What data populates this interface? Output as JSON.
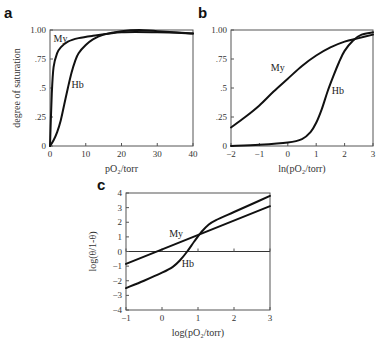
{
  "figure": {
    "panels": [
      "a",
      "b",
      "c"
    ]
  },
  "chart_data": [
    {
      "panel": "a",
      "type": "line",
      "title": "",
      "xlabel": "pO2/torr",
      "ylabel": "degree of saturation",
      "xlim": [
        0,
        40
      ],
      "ylim": [
        0,
        1
      ],
      "xticks": [
        0,
        10,
        20,
        30,
        40
      ],
      "xtick_labels": [
        "0",
        "10",
        "20",
        "30",
        "40"
      ],
      "yticks": [
        0,
        0.25,
        0.5,
        0.75,
        1.0
      ],
      "ytick_labels": [
        "0",
        ".25",
        ".5",
        ".75",
        "1.00"
      ],
      "grid": false,
      "series": [
        {
          "name": "My",
          "x": [
            0,
            0.5,
            1,
            2,
            3,
            5,
            8,
            12,
            20,
            30,
            40
          ],
          "y": [
            0,
            0.45,
            0.68,
            0.8,
            0.85,
            0.9,
            0.93,
            0.95,
            0.98,
            0.98,
            0.97
          ],
          "label_pos": [
            1,
            0.9
          ]
        },
        {
          "name": "Hb",
          "x": [
            0,
            1,
            2,
            3,
            4,
            5,
            6,
            7,
            8,
            10,
            12,
            15,
            20,
            25,
            30,
            40
          ],
          "y": [
            0,
            0.05,
            0.12,
            0.22,
            0.36,
            0.5,
            0.63,
            0.73,
            0.8,
            0.87,
            0.92,
            0.96,
            0.99,
            1.0,
            0.99,
            0.97
          ],
          "label_pos": [
            6,
            0.5
          ]
        }
      ]
    },
    {
      "panel": "b",
      "type": "line",
      "title": "",
      "xlabel": "ln(pO2/torr)",
      "ylabel": "",
      "xlim": [
        -2,
        3
      ],
      "ylim": [
        0,
        1
      ],
      "xticks": [
        -2,
        -1,
        0,
        1,
        2,
        3
      ],
      "xtick_labels": [
        "-2",
        "-1",
        "0",
        "1",
        "2",
        "3"
      ],
      "yticks": [
        0,
        0.25,
        0.5,
        0.75,
        1.0
      ],
      "ytick_labels": [
        "0",
        ".25",
        ".5",
        ".75",
        "1.00"
      ],
      "grid": false,
      "series": [
        {
          "name": "My",
          "x": [
            -2,
            -1.5,
            -1,
            -0.5,
            0,
            0.5,
            1,
            1.5,
            2,
            2.5,
            3
          ],
          "y": [
            0.16,
            0.25,
            0.35,
            0.47,
            0.58,
            0.69,
            0.78,
            0.85,
            0.9,
            0.93,
            0.96
          ],
          "label_pos": [
            -0.6,
            0.65
          ]
        },
        {
          "name": "Hb",
          "x": [
            -2,
            -1,
            0,
            0.5,
            0.8,
            1,
            1.2,
            1.4,
            1.6,
            1.8,
            2,
            2.3,
            2.6,
            3
          ],
          "y": [
            0.0,
            0.01,
            0.03,
            0.06,
            0.12,
            0.2,
            0.32,
            0.47,
            0.6,
            0.72,
            0.82,
            0.91,
            0.96,
            0.98
          ],
          "label_pos": [
            1.55,
            0.45
          ]
        }
      ]
    },
    {
      "panel": "c",
      "type": "line",
      "title": "",
      "xlabel": "log(pO2/torr)",
      "ylabel": "log(θ/1-θ)",
      "xlim": [
        -1,
        3
      ],
      "ylim": [
        -4,
        4
      ],
      "xticks": [
        -1,
        0,
        1,
        2,
        3
      ],
      "xtick_labels": [
        "-1",
        "0",
        "1",
        "2",
        "3"
      ],
      "yticks": [
        -4,
        -3,
        -2,
        -1,
        0,
        1,
        2,
        3,
        4
      ],
      "ytick_labels": [
        "-4",
        "-3",
        "-2",
        "-1",
        "0",
        "1",
        "2",
        "3",
        "4"
      ],
      "grid": false,
      "zero_line": true,
      "series": [
        {
          "name": "My",
          "x": [
            -1,
            3
          ],
          "y": [
            -0.85,
            3.1
          ],
          "label_pos": [
            0.2,
            1.0
          ]
        },
        {
          "name": "Hb",
          "x": [
            -1,
            -0.5,
            0,
            0.3,
            0.5,
            0.7,
            0.9,
            1.1,
            1.3,
            1.5,
            2,
            2.5,
            3
          ],
          "y": [
            -2.5,
            -2.0,
            -1.45,
            -1.05,
            -0.6,
            0.0,
            0.7,
            1.35,
            1.85,
            2.15,
            2.7,
            3.25,
            3.8
          ],
          "label_pos": [
            0.55,
            -1.05
          ]
        }
      ]
    }
  ],
  "labels": {
    "panel_a": "a",
    "panel_b": "b",
    "panel_c": "c"
  }
}
